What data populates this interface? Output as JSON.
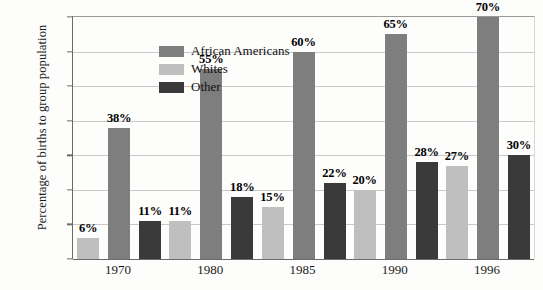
{
  "chart_data": {
    "type": "bar",
    "title": "",
    "xlabel": "",
    "ylabel": "Percentage of births to group population",
    "ylim": [
      0,
      70
    ],
    "grid": true,
    "legend_position": "top-left-inside",
    "categories": [
      "1970",
      "1980",
      "1985",
      "1990",
      "1996"
    ],
    "ytick_labels": [
      "0",
      "10%",
      "20%",
      "30%",
      "40%",
      "50%",
      "60%",
      "70%"
    ],
    "ytick_values": [
      0,
      10,
      20,
      30,
      40,
      50,
      60,
      70
    ],
    "series": [
      {
        "name": "Whites",
        "key": "c-wh",
        "color": "#bfbfbf",
        "values": [
          6,
          11,
          15,
          20,
          27
        ],
        "labels": [
          "6%",
          "11%",
          "15%",
          "20%",
          "27%"
        ]
      },
      {
        "name": "African Americans",
        "key": "c-aa",
        "color": "#7e7e7e",
        "values": [
          38,
          55,
          60,
          65,
          70
        ],
        "labels": [
          "38%",
          "55%",
          "60%",
          "65%",
          "70%"
        ]
      },
      {
        "name": "Other",
        "key": "c-ot",
        "color": "#3a3a3a",
        "values": [
          11,
          18,
          22,
          28,
          30
        ],
        "labels": [
          "11%",
          "18%",
          "22%",
          "28%",
          "30%"
        ]
      }
    ],
    "legend": [
      {
        "label": "African Americans",
        "key": "c-aa",
        "color": "#7e7e7e"
      },
      {
        "label": "Whites",
        "key": "c-wh",
        "color": "#bfbfbf"
      },
      {
        "label": "Other",
        "key": "c-ot",
        "color": "#3a3a3a"
      }
    ],
    "bar_order": [
      "Whites",
      "African Americans",
      "Other"
    ]
  }
}
